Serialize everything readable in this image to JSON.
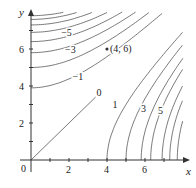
{
  "chart_data": {
    "type": "contour",
    "title": "",
    "xlabel": "x",
    "ylabel": "y",
    "xlim": [
      0,
      8
    ],
    "ylim": [
      0,
      8
    ],
    "grid": false,
    "x_ticks": [
      2,
      4,
      6
    ],
    "x_minor_ticks": [
      1,
      3,
      5,
      7
    ],
    "y_ticks": [
      2,
      4,
      6
    ],
    "y_minor_ticks": [
      1,
      3,
      5,
      7
    ],
    "origin_label": "0",
    "zero_contour": {
      "label": "0",
      "from": [
        0,
        0
      ],
      "to": [
        3.4,
        3.4
      ]
    },
    "positive_contours_x_intercepts": [
      4,
      5,
      5.8,
      6.3,
      6.9,
      7.3,
      7.7
    ],
    "negative_contours_y_intercepts": [
      3.9,
      5.0,
      5.8,
      6.4,
      6.9,
      7.3,
      7.6,
      7.8
    ],
    "contour_labels": [
      {
        "text": "1",
        "x": 4.5,
        "y": 3.0
      },
      {
        "text": "3",
        "x": 6.0,
        "y": 2.8
      },
      {
        "text": "5",
        "x": 6.9,
        "y": 2.7
      },
      {
        "text": "−1",
        "x": 2.4,
        "y": 4.5
      },
      {
        "text": "−3",
        "x": 2.0,
        "y": 5.95
      },
      {
        "text": "−5",
        "x": 1.8,
        "y": 6.9
      }
    ],
    "annotated_point": {
      "x": 4,
      "y": 6,
      "label": "(4, 6)"
    }
  },
  "layout": {
    "origin_px": [
      31,
      160
    ],
    "px_per_unit_x": 19,
    "px_per_unit_y": 18.5
  }
}
